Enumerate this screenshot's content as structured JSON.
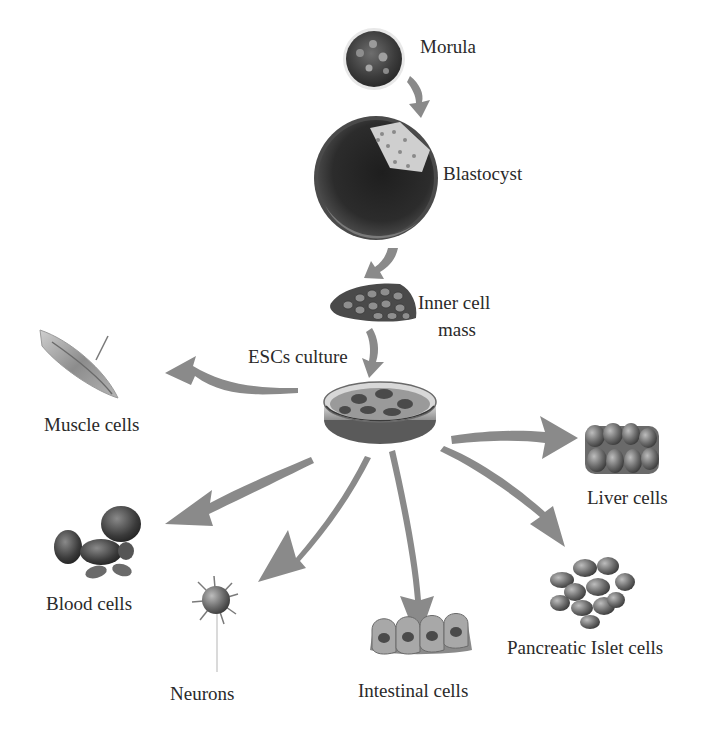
{
  "diagram": {
    "type": "embryonic-stem-cell-differentiation",
    "colors": {
      "arrow": "#8a8a8a",
      "cell_dark": "#3a3a3a",
      "cell_mid": "#7a7a7a",
      "cell_light": "#c8c8c8",
      "text": "#2a2a2a"
    },
    "stages": [
      {
        "id": "morula",
        "label": "Morula"
      },
      {
        "id": "blastocyst",
        "label": "Blastocyst"
      },
      {
        "id": "inner-cell-mass",
        "label_line1": "Inner cell",
        "label_line2": "mass"
      },
      {
        "id": "esc-culture",
        "label": "ESCs culture"
      }
    ],
    "outputs": [
      {
        "id": "muscle",
        "label": "Muscle cells"
      },
      {
        "id": "liver",
        "label": "Liver cells"
      },
      {
        "id": "blood",
        "label": "Blood cells"
      },
      {
        "id": "neurons",
        "label": "Neurons"
      },
      {
        "id": "intestinal",
        "label": "Intestinal cells"
      },
      {
        "id": "pancreatic",
        "label": "Pancreatic Islet cells"
      }
    ]
  }
}
